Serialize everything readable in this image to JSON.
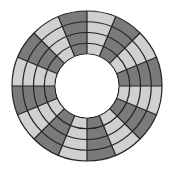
{
  "diagram": {
    "title": "",
    "type": "segmented-annulus",
    "center": [
      87,
      86
    ],
    "outer_radius": 75,
    "inner_radius": 32,
    "ring_count": 4,
    "sector_count": 16,
    "start_angle_deg": 0,
    "colors": {
      "dark": "#7a7a7a",
      "light": "#d0d0d0",
      "stroke": "#222222",
      "background": "#ffffff"
    },
    "sectors": [
      {
        "index": 0,
        "from_deg": 0,
        "to_deg": 22.5,
        "shade": "light"
      },
      {
        "index": 1,
        "from_deg": 22.5,
        "to_deg": 45,
        "shade": "dark"
      },
      {
        "index": 2,
        "from_deg": 45,
        "to_deg": 67.5,
        "shade": "light"
      },
      {
        "index": 3,
        "from_deg": 67.5,
        "to_deg": 90,
        "shade": "dark"
      },
      {
        "index": 4,
        "from_deg": 90,
        "to_deg": 112.5,
        "shade": "light"
      },
      {
        "index": 5,
        "from_deg": 112.5,
        "to_deg": 135,
        "shade": "dark"
      },
      {
        "index": 6,
        "from_deg": 135,
        "to_deg": 157.5,
        "shade": "light"
      },
      {
        "index": 7,
        "from_deg": 157.5,
        "to_deg": 180,
        "shade": "dark"
      },
      {
        "index": 8,
        "from_deg": 180,
        "to_deg": 202.5,
        "shade": "light"
      },
      {
        "index": 9,
        "from_deg": 202.5,
        "to_deg": 225,
        "shade": "dark"
      },
      {
        "index": 10,
        "from_deg": 225,
        "to_deg": 247.5,
        "shade": "light"
      },
      {
        "index": 11,
        "from_deg": 247.5,
        "to_deg": 270,
        "shade": "dark"
      },
      {
        "index": 12,
        "from_deg": 270,
        "to_deg": 292.5,
        "shade": "light"
      },
      {
        "index": 13,
        "from_deg": 292.5,
        "to_deg": 315,
        "shade": "dark"
      },
      {
        "index": 14,
        "from_deg": 315,
        "to_deg": 337.5,
        "shade": "light"
      },
      {
        "index": 15,
        "from_deg": 337.5,
        "to_deg": 360,
        "shade": "dark"
      }
    ]
  }
}
